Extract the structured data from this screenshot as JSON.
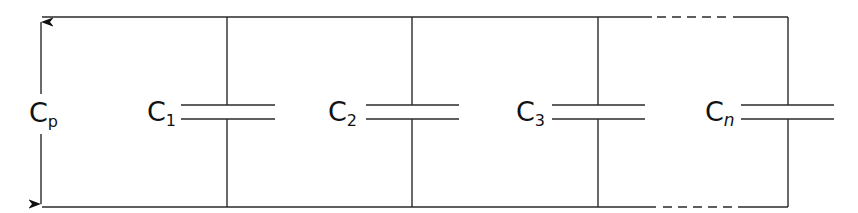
{
  "diagram": {
    "type": "parallel-capacitor-circuit",
    "colors": {
      "line": "#2a2a2a",
      "text": "#111111",
      "background": "#ffffff"
    },
    "total_label": {
      "main": "C",
      "sub": "p"
    },
    "capacitors": [
      {
        "main": "C",
        "sub": "1",
        "sub_italic": false
      },
      {
        "main": "C",
        "sub": "2",
        "sub_italic": false
      },
      {
        "main": "C",
        "sub": "3",
        "sub_italic": false
      },
      {
        "main": "C",
        "sub": "n",
        "sub_italic": true
      }
    ],
    "continuation": "dashed segment between C3 and Cn on top and bottom rails"
  }
}
